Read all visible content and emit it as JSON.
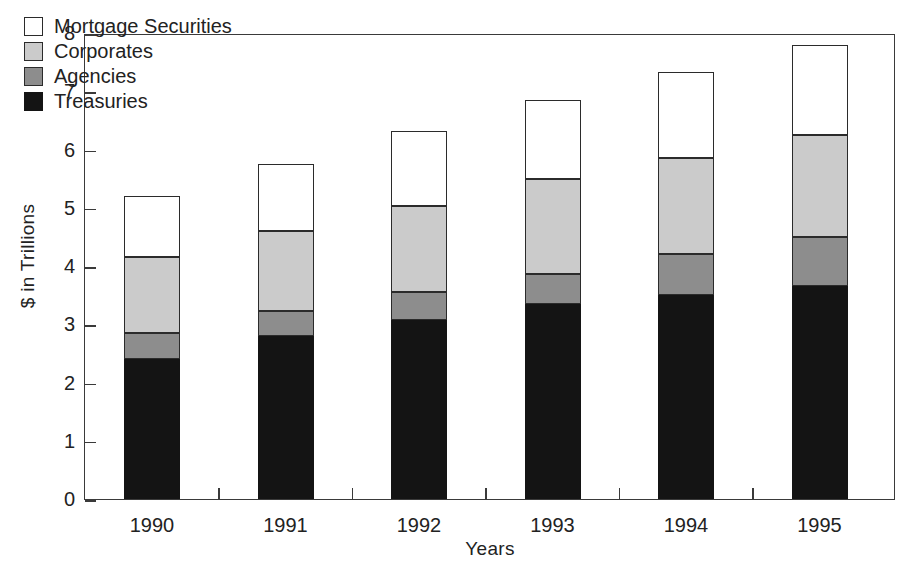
{
  "chart_data": {
    "type": "bar",
    "subtype": "stacked-bar",
    "title": "",
    "xlabel": "Years",
    "ylabel": "$ in Trillions",
    "categories": [
      "1990",
      "1991",
      "1992",
      "1993",
      "1994",
      "1995"
    ],
    "ylim": [
      0,
      8
    ],
    "yticks": [
      "0",
      "1",
      "2",
      "3",
      "4",
      "5",
      "6",
      "7",
      "8"
    ],
    "ytick_values": [
      0,
      1,
      2,
      3,
      4,
      5,
      6,
      7,
      8
    ],
    "grid": false,
    "legend_position": "top-left",
    "stack_order_bottom_to_top": [
      "Treasuries",
      "Agencies",
      "Corporates",
      "Mortgage Securities"
    ],
    "series": [
      {
        "name": "Treasuries",
        "color": "#141414",
        "values": [
          2.4,
          2.8,
          3.08,
          3.35,
          3.5,
          3.65
        ]
      },
      {
        "name": "Agencies",
        "color": "#8d8d8d",
        "values": [
          0.45,
          0.42,
          0.47,
          0.52,
          0.7,
          0.85
        ]
      },
      {
        "name": "Corporates",
        "color": "#cbcbcb",
        "values": [
          1.3,
          1.38,
          1.48,
          1.63,
          1.65,
          1.75
        ]
      },
      {
        "name": "Mortgage Securities",
        "color": "#ffffff",
        "values": [
          1.05,
          1.15,
          1.28,
          1.35,
          1.48,
          1.55
        ]
      }
    ],
    "totals": [
      5.2,
      5.75,
      6.31,
      6.85,
      7.33,
      7.8
    ]
  },
  "legend": {
    "items": [
      {
        "label": "Mortgage Securities",
        "key": "mortgage"
      },
      {
        "label": "Corporates",
        "key": "corporates"
      },
      {
        "label": "Agencies",
        "key": "agencies"
      },
      {
        "label": "Treasuries",
        "key": "treasuries"
      }
    ]
  }
}
